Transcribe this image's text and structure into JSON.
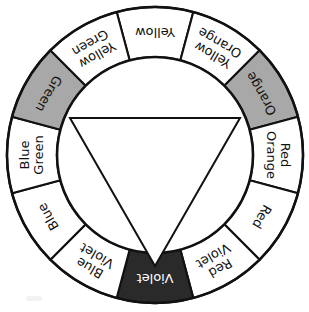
{
  "figure": {
    "name": "color-wheel",
    "center": {
      "x": 155,
      "y": 155
    },
    "outer_radius": 148,
    "inner_radius": 98,
    "background": "#ffffff",
    "outline_color": "#111111",
    "fills": {
      "plain": "#ffffff",
      "gray": "#a8a8a8",
      "dark": "#2a2a2a",
      "light_text": "#ffffff",
      "dark_text": "#111111"
    },
    "segment_count": 12,
    "triangle": {
      "name": "inverted-triangle",
      "points": "70,118 240,118 155,266",
      "fill": "#ffffff",
      "stroke": "#111111"
    }
  },
  "segments": [
    {
      "label": "Yellow",
      "lines": [
        "Yellow"
      ],
      "fill": "plain",
      "text": "dark",
      "mid_angle": -90,
      "flipped": true
    },
    {
      "label": "Yellow Orange",
      "lines": [
        "Yellow",
        "Orange"
      ],
      "fill": "plain",
      "text": "dark",
      "mid_angle": -60,
      "flipped": true
    },
    {
      "label": "Orange",
      "lines": [
        "Orange"
      ],
      "fill": "gray",
      "text": "dark",
      "mid_angle": -30,
      "flipped": true
    },
    {
      "label": "Red Orange",
      "lines": [
        "Red",
        "Orange"
      ],
      "fill": "plain",
      "text": "dark",
      "mid_angle": 0,
      "flipped": false
    },
    {
      "label": "Red",
      "lines": [
        "Red"
      ],
      "fill": "plain",
      "text": "dark",
      "mid_angle": 30,
      "flipped": false
    },
    {
      "label": "Red Violet",
      "lines": [
        "Red",
        "Violet"
      ],
      "fill": "plain",
      "text": "dark",
      "mid_angle": 60,
      "flipped": false
    },
    {
      "label": "Violet",
      "lines": [
        "Violet"
      ],
      "fill": "dark",
      "text": "light",
      "mid_angle": 90,
      "flipped": false
    },
    {
      "label": "Blue Violet",
      "lines": [
        "Blue",
        "Violet"
      ],
      "fill": "plain",
      "text": "dark",
      "mid_angle": 120,
      "flipped": false
    },
    {
      "label": "Blue",
      "lines": [
        "Blue"
      ],
      "fill": "plain",
      "text": "dark",
      "mid_angle": 150,
      "flipped": false
    },
    {
      "label": "Blue Green",
      "lines": [
        "Blue",
        "Green"
      ],
      "fill": "plain",
      "text": "dark",
      "mid_angle": 180,
      "flipped": false
    },
    {
      "label": "Green",
      "lines": [
        "Green"
      ],
      "fill": "gray",
      "text": "dark",
      "mid_angle": 210,
      "flipped": true
    },
    {
      "label": "Yellow Green",
      "lines": [
        "Yellow",
        "Green"
      ],
      "fill": "plain",
      "text": "dark",
      "mid_angle": 240,
      "flipped": true
    }
  ]
}
